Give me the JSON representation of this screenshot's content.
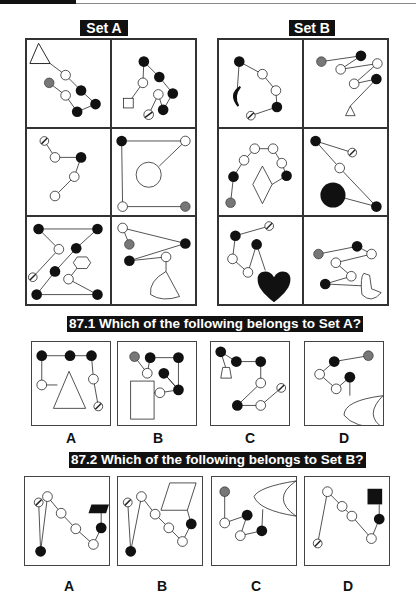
{
  "set_a": {
    "label": "Set A"
  },
  "set_b": {
    "label": "Set B"
  },
  "question_1": {
    "text": "87.1 Which of the following belongs to Set A?",
    "options": [
      {
        "label": "A"
      },
      {
        "label": "B"
      },
      {
        "label": "C"
      },
      {
        "label": "D"
      }
    ]
  },
  "question_2": {
    "text": "87.2 Which of the following belongs to Set B?",
    "options": [
      {
        "label": "A"
      },
      {
        "label": "B"
      },
      {
        "label": "C"
      },
      {
        "label": "D"
      }
    ]
  },
  "colors": {
    "black": "#111111",
    "grey": "#777777",
    "white": "#ffffff",
    "stroke": "#222222"
  }
}
